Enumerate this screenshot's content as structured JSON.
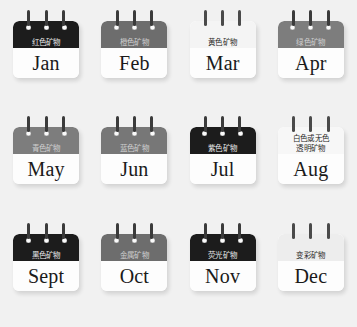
{
  "page": {
    "background_color": "#f1f1f1"
  },
  "legend": {
    "note": "Twelve calendar-style cards, one per month, each labelled with a mineral colour/type category in Chinese."
  },
  "cards": [
    {
      "month": "Jan",
      "category": "红色矿物",
      "category_lines": [
        "红色矿物"
      ],
      "header_color": "#1c1c1c",
      "text_color": "#e9e9e9",
      "tone": "black"
    },
    {
      "month": "Feb",
      "category": "橙色矿物",
      "category_lines": [
        "橙色矿物"
      ],
      "header_color": "#6d6d6d",
      "text_color": "#cfcfcf",
      "tone": "dark"
    },
    {
      "month": "Mar",
      "category": "黄色矿物",
      "category_lines": [
        "黄色矿物"
      ],
      "header_color": "#f4f4f4",
      "text_color": "#2b2b2b",
      "tone": "light"
    },
    {
      "month": "Apr",
      "category": "绿色矿物",
      "category_lines": [
        "绿色矿物"
      ],
      "header_color": "#7d7d7d",
      "text_color": "#cfcfcf",
      "tone": "mid"
    },
    {
      "month": "May",
      "category": "青色矿物",
      "category_lines": [
        "青色矿物"
      ],
      "header_color": "#828282",
      "text_color": "#cfcfcf",
      "tone": "mid"
    },
    {
      "month": "Jun",
      "category": "蓝色矿物",
      "category_lines": [
        "蓝色矿物"
      ],
      "header_color": "#727272",
      "text_color": "#cfcfcf",
      "tone": "dark"
    },
    {
      "month": "Jul",
      "category": "紫色矿物",
      "category_lines": [
        "紫色矿物"
      ],
      "header_color": "#171717",
      "text_color": "#e9e9e9",
      "tone": "black"
    },
    {
      "month": "Aug",
      "category": "白色或无色透明矿物",
      "category_lines": [
        "白色或无色",
        "透明矿物"
      ],
      "header_color": "#f7f7f7",
      "text_color": "#2b2b2b",
      "tone": "white"
    },
    {
      "month": "Sept",
      "category": "黑色矿物",
      "category_lines": [
        "黑色矿物"
      ],
      "header_color": "#141414",
      "text_color": "#e9e9e9",
      "tone": "black"
    },
    {
      "month": "Oct",
      "category": "金属矿物",
      "category_lines": [
        "金属矿物"
      ],
      "header_color": "#6e6e6e",
      "text_color": "#cfcfcf",
      "tone": "dark"
    },
    {
      "month": "Nov",
      "category": "荧光矿物",
      "category_lines": [
        "荧光矿物"
      ],
      "header_color": "#151515",
      "text_color": "#e9e9e9",
      "tone": "black"
    },
    {
      "month": "Dec",
      "category": "变彩矿物",
      "category_lines": [
        "变彩矿物"
      ],
      "header_color": "#efefef",
      "text_color": "#2b2b2b",
      "tone": "light"
    }
  ]
}
